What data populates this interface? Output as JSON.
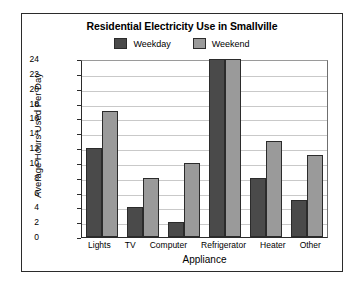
{
  "chart_data": {
    "type": "bar",
    "title": "Residential Electricity Use in Smallville",
    "xlabel": "Appliance",
    "ylabel": "Average Hours Used Per Day",
    "categories": [
      "Lights",
      "TV",
      "Computer",
      "Refrigerator",
      "Heater",
      "Other"
    ],
    "series": [
      {
        "name": "Weekday",
        "color": "#4a4a4a",
        "values": [
          12,
          4,
          2,
          24,
          8,
          5
        ]
      },
      {
        "name": "Weekend",
        "color": "#9a9a9a",
        "values": [
          17,
          8,
          10,
          24,
          13,
          11
        ]
      }
    ],
    "ylim": [
      0,
      24
    ],
    "ytick_step": 2,
    "yticks": [
      0,
      2,
      4,
      6,
      8,
      10,
      12,
      14,
      16,
      18,
      20,
      22,
      24
    ],
    "grid": true,
    "legend_position": "top"
  }
}
